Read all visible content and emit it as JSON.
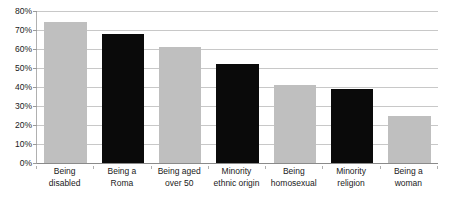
{
  "chart_data": {
    "type": "bar",
    "title": "",
    "subtitle": "",
    "xlabel": "",
    "ylabel": "",
    "ylim": [
      0,
      80
    ],
    "grid": true,
    "legend": "none",
    "y_tick_labels": [
      "80%",
      "70%",
      "60%",
      "50%",
      "40%",
      "30%",
      "20%",
      "10%",
      "0%"
    ],
    "y_tick_values": [
      80,
      70,
      60,
      50,
      40,
      30,
      20,
      10,
      0
    ],
    "categories": [
      "Being disabled",
      "Being a Roma",
      "Being aged over 50",
      "Minority ethnic origin",
      "Being homosexual",
      "Minority religion",
      "Being a woman"
    ],
    "category_lines": [
      [
        "Being",
        "disabled"
      ],
      [
        "Being a",
        "Roma"
      ],
      [
        "Being aged",
        "over 50"
      ],
      [
        "Minority",
        "ethnic origin"
      ],
      [
        "Being",
        "homosexual"
      ],
      [
        "Minority",
        "religion"
      ],
      [
        "Being a",
        "woman"
      ]
    ],
    "values": [
      74,
      68,
      61,
      52,
      41,
      39,
      25
    ],
    "bar_colors": [
      "#bfbfbf",
      "#0a0a0a",
      "#bfbfbf",
      "#0a0a0a",
      "#bfbfbf",
      "#0a0a0a",
      "#bfbfbf"
    ],
    "colors": {
      "gray_bar": "#bfbfbf",
      "black_bar": "#0a0a0a",
      "gridline": "#c8c8c8",
      "axis": "#8a8a8a",
      "text": "#1a1a1a",
      "background": "#ffffff"
    }
  }
}
